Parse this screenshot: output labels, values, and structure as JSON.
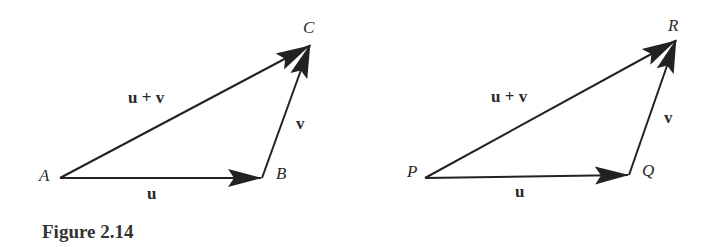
{
  "figure": {
    "caption": "Figure 2.14",
    "diagrams": [
      {
        "points": {
          "start": "A",
          "middle": "B",
          "end": "C"
        },
        "vectors": {
          "first": "u",
          "second": "v",
          "sum": "u + v"
        }
      },
      {
        "points": {
          "start": "P",
          "middle": "Q",
          "end": "R"
        },
        "vectors": {
          "first": "u",
          "second": "v",
          "sum": "u + v"
        }
      }
    ]
  }
}
